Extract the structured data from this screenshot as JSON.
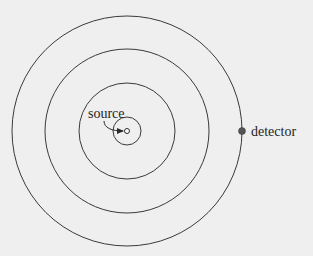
{
  "diagram": {
    "type": "concentric-wavefronts",
    "center": {
      "x": 127,
      "y": 131
    },
    "rings": [
      {
        "radius": 14
      },
      {
        "radius": 48
      },
      {
        "radius": 82
      },
      {
        "radius": 115
      }
    ],
    "source": {
      "label": "source",
      "label_pos": {
        "x": 88,
        "y": 118
      },
      "marker_radius": 2.5
    },
    "detector": {
      "label": "detector",
      "pos": {
        "x": 242,
        "y": 131
      },
      "label_pos": {
        "x": 251,
        "y": 136
      },
      "marker_radius": 3.5
    },
    "colors": {
      "background": "#efefef",
      "line": "#3a3a3a",
      "text": "#1e1e1e",
      "detector_fill": "#555555"
    }
  }
}
